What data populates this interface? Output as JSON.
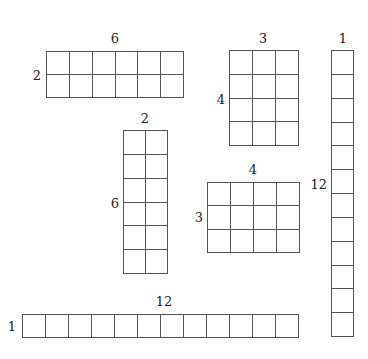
{
  "rectangles": [
    {
      "id": "r6x2",
      "cols": 6,
      "rows": 2,
      "top_label": "6",
      "left_label": "2",
      "x": 46,
      "y": 51,
      "w": 138,
      "h": 47
    },
    {
      "id": "r3x4",
      "cols": 3,
      "rows": 4,
      "top_label": "3",
      "left_label": "4",
      "x": 229,
      "y": 50,
      "w": 70,
      "h": 96
    },
    {
      "id": "r1x12",
      "cols": 1,
      "rows": 12,
      "top_label": "1",
      "left_label": "12",
      "x": 331,
      "y": 50,
      "w": 23,
      "h": 287
    },
    {
      "id": "r2x6",
      "cols": 2,
      "rows": 6,
      "top_label": "2",
      "left_label": "6",
      "x": 123,
      "y": 130,
      "w": 45,
      "h": 144
    },
    {
      "id": "r4x3",
      "cols": 4,
      "rows": 3,
      "top_label": "4",
      "left_label": "3",
      "x": 207,
      "y": 182,
      "w": 93,
      "h": 71
    },
    {
      "id": "r12x1",
      "cols": 12,
      "rows": 1,
      "top_label": "12",
      "left_label": "1",
      "x": 22,
      "y": 314,
      "w": 277,
      "h": 24
    }
  ],
  "colors": {
    "line": "#555555",
    "text": "#222222",
    "background": "#ffffff"
  }
}
